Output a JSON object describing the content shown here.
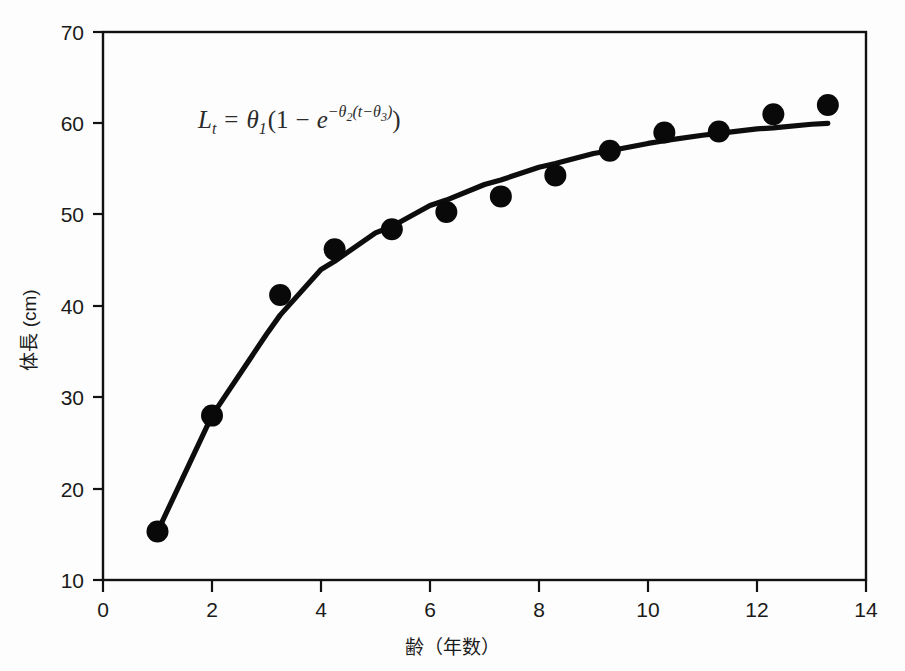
{
  "figure": {
    "background_color": "#fdfdfd",
    "ink_color": "#111111"
  },
  "chart_data": {
    "type": "scatter",
    "title": "",
    "subtitle": "",
    "xlabel": "齢（年数）",
    "ylabel": "体長 (cm)",
    "xlim": [
      0,
      14
    ],
    "ylim": [
      10,
      70
    ],
    "xticks": [
      0,
      2,
      4,
      6,
      8,
      10,
      12,
      14
    ],
    "yticks": [
      10,
      20,
      30,
      40,
      50,
      60,
      70
    ],
    "xtick_labels": [
      "0",
      "2",
      "4",
      "6",
      "8",
      "10",
      "12",
      "14"
    ],
    "ytick_labels": [
      "10",
      "20",
      "30",
      "40",
      "50",
      "60",
      "70"
    ],
    "grid": false,
    "legend": null,
    "annotation": {
      "text": "L_t = θ₁(1 − e^{−θ₂(t−θ₃)})",
      "x": 4.0,
      "y": 63.0,
      "parts": {
        "lhs_var": "L",
        "lhs_sub": "t",
        "equals": "=",
        "theta1": "θ",
        "theta1_sub": "1",
        "open_paren": "(",
        "one": "1",
        "minus": "−",
        "e": "e",
        "exp_minus": "−",
        "theta2": "θ",
        "theta2_sub": "2",
        "exp_open": "(",
        "exp_t": "t",
        "exp_minus2": "−",
        "theta3": "θ",
        "theta3_sub": "3",
        "exp_close": ")",
        "close_paren": ")"
      }
    },
    "series": [
      {
        "name": "observed",
        "marker": "filled-circle",
        "marker_color": "#090909",
        "marker_size": 11,
        "x": [
          1.0,
          2.0,
          3.25,
          4.25,
          5.3,
          6.3,
          7.3,
          8.3,
          9.3,
          10.3,
          11.3,
          12.3,
          13.3
        ],
        "y": [
          15.3,
          28.0,
          41.2,
          46.2,
          48.4,
          50.3,
          52.0,
          54.3,
          57.0,
          59.0,
          59.1,
          61.0,
          62.0
        ]
      },
      {
        "name": "fitted-von-bertalanffy-curve",
        "marker": "none",
        "line_color": "#0d0d0d",
        "line_width": 5,
        "x": [
          1.0,
          2.0,
          3.0,
          3.25,
          4.0,
          4.25,
          5.0,
          5.3,
          6.0,
          6.3,
          7.0,
          7.3,
          8.0,
          8.3,
          9.0,
          9.3,
          10.0,
          10.3,
          11.0,
          11.3,
          12.0,
          12.3,
          13.0,
          13.3
        ],
        "y": [
          15.3,
          28.0,
          36.9,
          39.0,
          44.0,
          44.9,
          48.0,
          48.7,
          51.0,
          51.6,
          53.3,
          53.8,
          55.2,
          55.6,
          56.7,
          57.0,
          57.8,
          58.1,
          58.7,
          58.9,
          59.4,
          59.5,
          59.9,
          60.0
        ]
      }
    ]
  }
}
